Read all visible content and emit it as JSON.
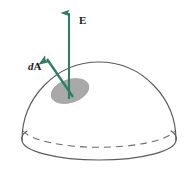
{
  "figure": {
    "background_color": "#ffffff",
    "labels": {
      "field_vector": "E",
      "area_element_prefix": "d",
      "area_element_symbol": "A",
      "area_element_full": "dA"
    },
    "colors": {
      "vector_green": "#2e7d64",
      "surface_outline": "#5b5b5b",
      "patch_fill": "#a9a9a9",
      "patch_outline": "#9a9a9a",
      "label_text": "#1a1a1a",
      "background": "#ffffff"
    },
    "geometry": {
      "dome_left_x": 22,
      "dome_right_x": 176,
      "dome_apex_x": 105,
      "dome_apex_y": 62,
      "base_center_y": 140,
      "rim_center_y": 122,
      "rim_radius_x": 77,
      "rim_radius_y": 18,
      "patch_center_x": 70,
      "patch_center_y": 91,
      "patch_radius_x": 19,
      "patch_radius_y": 11,
      "patch_rotation_deg": -18,
      "e_arrow_tip_y": 9,
      "e_arrow_base_y": 99,
      "e_arrow_x": 69,
      "da_arrow_tip_x": 44,
      "da_arrow_tip_y": 55,
      "da_arrow_base_x": 73,
      "da_arrow_base_y": 97
    },
    "elements": [
      "hemisphere-surface",
      "base-rim-front",
      "base-rim-back-dashed",
      "area-patch",
      "field-vector-arrow",
      "area-vector-arrow",
      "field-vector-label",
      "area-vector-label"
    ]
  }
}
